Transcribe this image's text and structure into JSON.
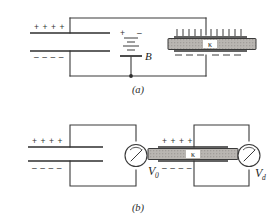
{
  "figure": {
    "panels": [
      {
        "id": "a",
        "caption": "(a)",
        "description": "Two parallel-plate capacitors connected to battery B; right capacitor contains dielectric slab K",
        "battery_label": "B",
        "left_capacitor": {
          "top_plate_signs": "+ +      + +",
          "bottom_plate_signs": "– –      – –"
        },
        "right_capacitor": {
          "slab_label": "κ",
          "top_induced": "induced-positive-ticks",
          "bottom_induced": "induced-negative-dashes"
        }
      },
      {
        "id": "b",
        "caption": "(b)",
        "description": "Two circuits each with a voltmeter; left reads V0, right with dielectric reads Vd",
        "left_circuit": {
          "top_plate_signs": "+ +      + +",
          "bottom_plate_signs": "– –      – –",
          "meter_label": "V",
          "meter_subscript": "0",
          "meter_name": "voltmeter-v0"
        },
        "right_circuit": {
          "top_plate_signs": "+ +      + +",
          "bottom_plate_signs": "– –      – –",
          "slab_label": "κ",
          "meter_label": "V",
          "meter_subscript": "d",
          "meter_name": "voltmeter-vd"
        }
      }
    ],
    "colors": {
      "background": "#ffffff",
      "wire": "#3a3a3a",
      "plate": "#2e2e2e",
      "slab_fill": "#b9b6b2",
      "text": "#222222"
    }
  }
}
